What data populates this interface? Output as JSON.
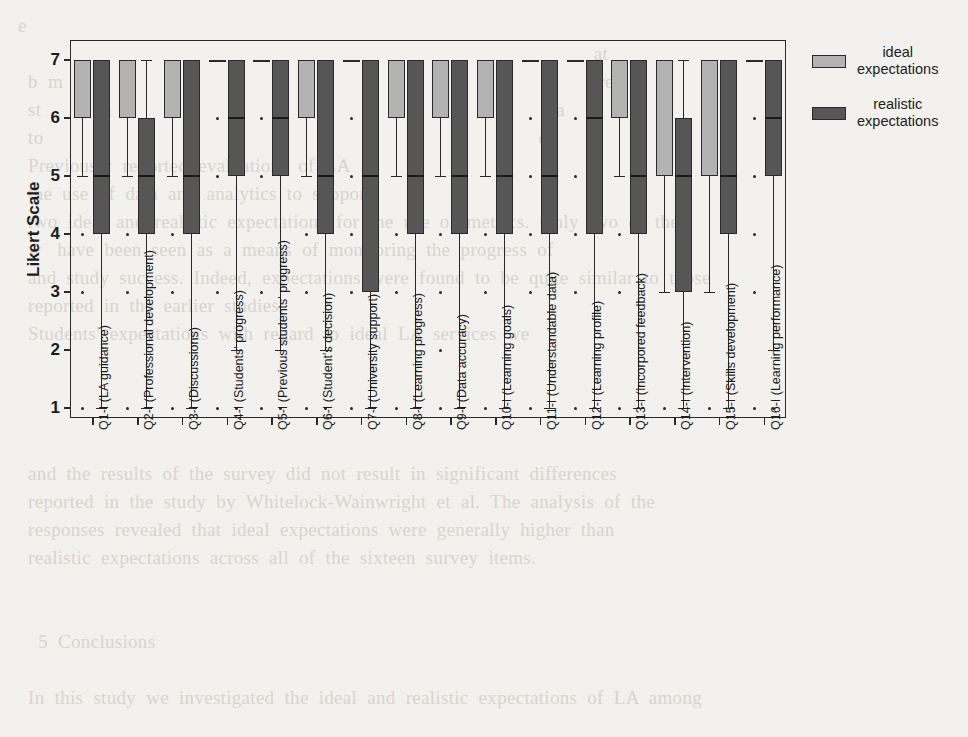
{
  "background_text": "e\n                                                                                                                  at\n  b  m                                                                                                          re\n  st            n                                                                                        a\n  to                                                                                                  d\n  Previously  reported  evaluations  of  LA\n  the  use  of  data  and  analytics  to  support\n  two  ideal  and  realistic  expectations  for  the  use  of  metrics.  Only  two  of  the\n  w   have  been  seen  as  a  means  of  monitoring  the  progress  of\n  and  study  success.  Indeed,  expectations  were  found  to  be  quite  similar  to  those\n  reported  in  the  earlier  studies.\n  Students'  expectations  with  regard  to  ideal  LA  services  we\n\n\n\n\n  and  the  results  of  the  survey  did  not  result  in  significant  differences\n  reported  in  the  study  by  Whitelock-Wainwright  et  al.  The  analysis  of  the\n  responses  revealed  that  ideal  expectations  were  generally  higher  than\n  realistic  expectations  across  all  of  the  sixteen  survey  items.\n\n\n    5  Conclusions\n\n  In  this  study  we  investigated  the  ideal  and  realistic  expectations  of  LA  among",
  "chart_data": {
    "type": "box",
    "title": "",
    "xlabel": "",
    "ylabel": "Likert Scale",
    "ylim": [
      0.6,
      7.45
    ],
    "yticks": [
      1,
      2,
      3,
      4,
      5,
      6,
      7
    ],
    "grid": false,
    "legend_position": "upper-right-outside",
    "legend": [
      {
        "name": "ideal expectations",
        "color": "#b3b3b3"
      },
      {
        "name": "realistic expectations",
        "color": "#565656"
      }
    ],
    "categories": [
      "Q1-I (LA guidance)",
      "Q2-I (Professional development)",
      "Q3-I (Discussions)",
      "Q4-I (Students' progress)",
      "Q5-I (Previous students' progress)",
      "Q6-I (Student's decision)",
      "Q7-I (University support)",
      "Q8-I (Learning progress)",
      "Q9-I (Data accuracy)",
      "Q10-I (Learning goals)",
      "Q11-I (Understandable data)",
      "Q12-I (Learning profile)",
      "Q13-I (Incorpored feedback)",
      "Q14-I (Intervention)",
      "Q15-I (Skills development)",
      "Q16-I (Learning performance)"
    ],
    "series": [
      {
        "name": "ideal expectations",
        "color": "#b3b3b3",
        "boxes": [
          {
            "q1": 6,
            "median": 7,
            "q3": 7,
            "whisker_low": 5,
            "whisker_high": 7,
            "outliers": [
              4,
              3,
              1
            ]
          },
          {
            "q1": 6,
            "median": 7,
            "q3": 7,
            "whisker_low": 5,
            "whisker_high": 7,
            "outliers": [
              4,
              3,
              1
            ]
          },
          {
            "q1": 6,
            "median": 7,
            "q3": 7,
            "whisker_low": 5,
            "whisker_high": 7,
            "outliers": [
              4,
              3,
              1
            ]
          },
          {
            "q1": 7,
            "median": 7,
            "q3": 7,
            "whisker_low": 7,
            "whisker_high": 7,
            "outliers": [
              6,
              5,
              3,
              1
            ]
          },
          {
            "q1": 7,
            "median": 7,
            "q3": 7,
            "whisker_low": 7,
            "whisker_high": 7,
            "outliers": [
              6,
              5,
              3,
              1
            ]
          },
          {
            "q1": 6,
            "median": 7,
            "q3": 7,
            "whisker_low": 5,
            "whisker_high": 7,
            "outliers": [
              4,
              3,
              1
            ]
          },
          {
            "q1": 7,
            "median": 7,
            "q3": 7,
            "whisker_low": 7,
            "whisker_high": 7,
            "outliers": [
              6,
              5,
              4,
              3,
              1
            ]
          },
          {
            "q1": 6,
            "median": 7,
            "q3": 7,
            "whisker_low": 5,
            "whisker_high": 7,
            "outliers": [
              4,
              3,
              1
            ]
          },
          {
            "q1": 6,
            "median": 7,
            "q3": 7,
            "whisker_low": 5,
            "whisker_high": 7,
            "outliers": [
              4,
              3,
              2,
              1
            ]
          },
          {
            "q1": 6,
            "median": 7,
            "q3": 7,
            "whisker_low": 5,
            "whisker_high": 7,
            "outliers": [
              4,
              3,
              1
            ]
          },
          {
            "q1": 7,
            "median": 7,
            "q3": 7,
            "whisker_low": 7,
            "whisker_high": 7,
            "outliers": [
              6,
              5,
              4,
              3,
              1
            ]
          },
          {
            "q1": 7,
            "median": 7,
            "q3": 7,
            "whisker_low": 7,
            "whisker_high": 7,
            "outliers": [
              6,
              5,
              4,
              3,
              1
            ]
          },
          {
            "q1": 6,
            "median": 7,
            "q3": 7,
            "whisker_low": 5,
            "whisker_high": 7,
            "outliers": [
              4,
              3,
              1
            ]
          },
          {
            "q1": 5,
            "median": 7,
            "q3": 7,
            "whisker_low": 3,
            "whisker_high": 7,
            "outliers": [
              1
            ]
          },
          {
            "q1": 5,
            "median": 7,
            "q3": 7,
            "whisker_low": 3,
            "whisker_high": 7,
            "outliers": [
              1
            ]
          },
          {
            "q1": 7,
            "median": 7,
            "q3": 7,
            "whisker_low": 7,
            "whisker_high": 7,
            "outliers": [
              6,
              5,
              4,
              3,
              1
            ]
          }
        ]
      },
      {
        "name": "realistic expectations",
        "color": "#565656",
        "boxes": [
          {
            "q1": 4,
            "median": 5,
            "q3": 7,
            "whisker_low": 1,
            "whisker_high": 7,
            "outliers": []
          },
          {
            "q1": 4,
            "median": 5,
            "q3": 6,
            "whisker_low": 1,
            "whisker_high": 7,
            "outliers": []
          },
          {
            "q1": 4,
            "median": 5,
            "q3": 7,
            "whisker_low": 1,
            "whisker_high": 7,
            "outliers": []
          },
          {
            "q1": 5,
            "median": 6,
            "q3": 7,
            "whisker_low": 2,
            "whisker_high": 7,
            "outliers": [
              1
            ]
          },
          {
            "q1": 5,
            "median": 6,
            "q3": 7,
            "whisker_low": 2,
            "whisker_high": 7,
            "outliers": [
              1
            ]
          },
          {
            "q1": 4,
            "median": 5,
            "q3": 7,
            "whisker_low": 2,
            "whisker_high": 7,
            "outliers": [
              1
            ]
          },
          {
            "q1": 3,
            "median": 5,
            "q3": 7,
            "whisker_low": 1,
            "whisker_high": 7,
            "outliers": []
          },
          {
            "q1": 4,
            "median": 5,
            "q3": 7,
            "whisker_low": 1,
            "whisker_high": 7,
            "outliers": []
          },
          {
            "q1": 4,
            "median": 5,
            "q3": 7,
            "whisker_low": 1,
            "whisker_high": 7,
            "outliers": []
          },
          {
            "q1": 4,
            "median": 5,
            "q3": 7,
            "whisker_low": 1,
            "whisker_high": 7,
            "outliers": []
          },
          {
            "q1": 4,
            "median": 5,
            "q3": 7,
            "whisker_low": 1,
            "whisker_high": 7,
            "outliers": []
          },
          {
            "q1": 4,
            "median": 6,
            "q3": 7,
            "whisker_low": 1,
            "whisker_high": 7,
            "outliers": []
          },
          {
            "q1": 4,
            "median": 5,
            "q3": 7,
            "whisker_low": 1,
            "whisker_high": 7,
            "outliers": []
          },
          {
            "q1": 3,
            "median": 5,
            "q3": 6,
            "whisker_low": 1,
            "whisker_high": 7,
            "outliers": []
          },
          {
            "q1": 4,
            "median": 5,
            "q3": 7,
            "whisker_low": 1,
            "whisker_high": 7,
            "outliers": []
          },
          {
            "q1": 5,
            "median": 6,
            "q3": 7,
            "whisker_low": 2,
            "whisker_high": 7,
            "outliers": [
              1
            ]
          }
        ]
      }
    ]
  }
}
